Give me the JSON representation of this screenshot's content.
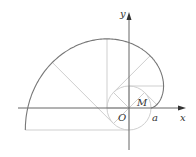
{
  "diagram": {
    "type": "involute-of-circle",
    "labels": {
      "x_axis": "x",
      "y_axis": "y",
      "origin": "O",
      "point_a": "a",
      "point_m": "M"
    },
    "colors": {
      "curve": "#777777",
      "axis": "#666666",
      "guide": "#cfcfcf"
    },
    "circle_radius_px": 22,
    "origin_px": [
      129,
      108
    ],
    "theta_steps": [
      "π/4",
      "π/2",
      "3π/4",
      "π",
      "5π/4",
      "3π/2"
    ]
  }
}
